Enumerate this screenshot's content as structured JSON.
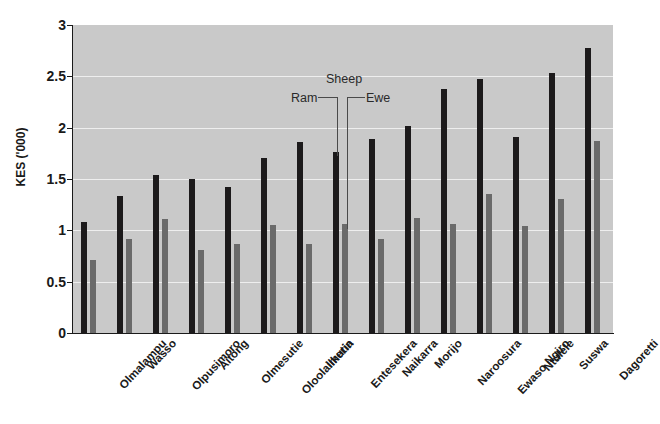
{
  "chart_data": {
    "type": "bar",
    "title": "",
    "xlabel": "",
    "ylabel": "KES ('000)",
    "ylim": [
      0,
      3
    ],
    "yticks": [
      "0",
      "0.5",
      "1",
      "1.5",
      "2",
      "2.5",
      "3"
    ],
    "grid": true,
    "legend_position": "inline-annotation",
    "annotations": [
      {
        "label": "Sheep",
        "role": "group-label"
      },
      {
        "label": "Ram",
        "role": "series-pointer",
        "points_to": "dark-bar"
      },
      {
        "label": "Ewe",
        "role": "series-pointer",
        "points_to": "gray-bar"
      }
    ],
    "categories": [
      "Olmalampu",
      "Wasso",
      "Olpusimoro",
      "Aitong",
      "Olmesutie",
      "Oloolaimutia",
      "Ilkerin",
      "Entesekera",
      "Naikarra",
      "Morijo",
      "Naroosura",
      "Ewaso Ngiro",
      "Ntulele",
      "Suswa",
      "Dagoretti"
    ],
    "series": [
      {
        "name": "Ram",
        "color": "#1c1a1b",
        "values": [
          1.08,
          1.33,
          1.54,
          1.5,
          1.42,
          1.7,
          1.86,
          1.76,
          1.89,
          2.02,
          2.38,
          2.47,
          1.91,
          2.53,
          2.78
        ]
      },
      {
        "name": "Ewe",
        "color": "#6a6a6a",
        "values": [
          0.71,
          0.92,
          1.11,
          0.81,
          0.87,
          1.05,
          0.87,
          1.06,
          0.92,
          1.12,
          1.06,
          1.35,
          1.04,
          1.31,
          1.87
        ]
      }
    ]
  },
  "colors": {
    "plot_background": "#c9c9c9",
    "gridline": "#eeeeee",
    "axis": "#1a1a1a",
    "ram_bar": "#1c1a1b",
    "ewe_bar": "#6a6a6a",
    "page_background": "#ffffff"
  }
}
